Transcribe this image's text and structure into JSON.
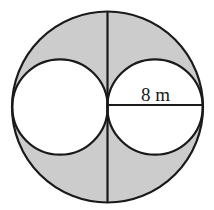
{
  "figure": {
    "kind": "geometry-diagram",
    "background_color": "#ffffff",
    "stroke_color": "#1a1a1a",
    "shaded_region_color": "#cccccc",
    "unshaded_region_color": "#ffffff",
    "stroke_width": 2.2
  },
  "shapes": {
    "outer_circle": {
      "name": "outer-circle",
      "cx": 107.5,
      "cy": 107,
      "r": 95.5,
      "fill": "#cccccc"
    },
    "left_inner_circle": {
      "name": "left-inner-circle",
      "cx": 60,
      "cy": 107,
      "r": 47.7,
      "fill": "#ffffff"
    },
    "right_inner_circle": {
      "name": "right-inner-circle",
      "cx": 155,
      "cy": 107,
      "r": 47.7,
      "fill": "#ffffff"
    }
  },
  "lines": {
    "vertical_diameter": {
      "name": "vertical-diameter-line",
      "x1": 107.5,
      "y1": 11.5,
      "x2": 107.5,
      "y2": 202.5
    },
    "horizontal_radius": {
      "name": "horizontal-radius-line",
      "x1": 107.5,
      "y1": 105,
      "x2": 203,
      "y2": 105
    }
  },
  "labels": {
    "dimension": {
      "text": "8 m",
      "value": "8",
      "unit": "m",
      "x": 141,
      "y": 101
    }
  }
}
